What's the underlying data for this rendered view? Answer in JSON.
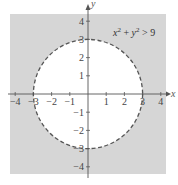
{
  "diagram": {
    "type": "inequality-region",
    "inequality_label": {
      "x_term": "x",
      "x_exp": "2",
      "plus": " + ",
      "y_term": "y",
      "y_exp": "2",
      "rest": " > 9"
    },
    "circle": {
      "center": [
        0,
        0
      ],
      "radius": 3,
      "boundary": "dashed",
      "shaded": "outside"
    },
    "x_axis": {
      "label": "x",
      "range": [
        -4,
        4
      ],
      "ticks": [
        "-4",
        "-3",
        "-2",
        "-1",
        "1",
        "2",
        "3",
        "4"
      ]
    },
    "y_axis": {
      "label": "y",
      "range": [
        -4,
        4
      ],
      "ticks": [
        "4",
        "3",
        "2",
        "1",
        "-1",
        "-2",
        "-3",
        "-4"
      ]
    },
    "colors": {
      "shade": "#d6d6d6",
      "inside": "#ffffff",
      "boundary": "#555555",
      "axis": "#555555"
    }
  }
}
